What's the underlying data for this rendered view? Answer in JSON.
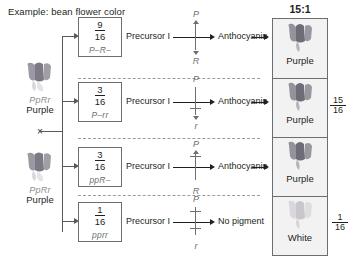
{
  "title": "Example: bean flower color",
  "colors": {
    "ink": "#231f20",
    "gray": "#6d6e71",
    "panel_bg": "#f2f2f2",
    "petal": "#7d7a86",
    "petal_white": "#d9d9d9"
  },
  "parents": [
    {
      "genotype": "PpRr",
      "phenotype": "Purple"
    },
    {
      "genotype": "PpRr",
      "phenotype": "Purple"
    }
  ],
  "cross_symbol": "×",
  "rows": [
    {
      "fraction_num": "9",
      "fraction_den": "16",
      "genotype": "P–R–",
      "precursor": "Precursor I",
      "product": "Anthocyanin",
      "enzyme_top": "P",
      "enzyme_bottom": "R",
      "top_blocked": false,
      "bottom_blocked": false
    },
    {
      "fraction_num": "3",
      "fraction_den": "16",
      "genotype": "P–rr",
      "precursor": "Precursor I",
      "product": "Anthocyanin",
      "enzyme_top": "P",
      "enzyme_bottom": "r",
      "top_blocked": false,
      "bottom_blocked": true
    },
    {
      "fraction_num": "3",
      "fraction_den": "16",
      "genotype": "ppR–",
      "precursor": "Precursor I",
      "product": "Anthocyanin",
      "enzyme_top": "P",
      "enzyme_bottom": "R",
      "top_blocked": true,
      "bottom_blocked": false
    },
    {
      "fraction_num": "1",
      "fraction_den": "16",
      "genotype": "pprr",
      "precursor": "Precursor I",
      "product": "No pigment",
      "enzyme_top": "P",
      "enzyme_bottom": "r",
      "top_blocked": true,
      "bottom_blocked": true
    }
  ],
  "results": {
    "ratio": "15:1",
    "cells": [
      {
        "phenotype": "Purple",
        "color": "purple"
      },
      {
        "phenotype": "Purple",
        "color": "purple"
      },
      {
        "phenotype": "Purple",
        "color": "purple"
      },
      {
        "phenotype": "White",
        "color": "white"
      }
    ],
    "summary_fractions": [
      {
        "num": "15",
        "den": "16"
      },
      {
        "num": "1",
        "den": "16"
      }
    ]
  }
}
